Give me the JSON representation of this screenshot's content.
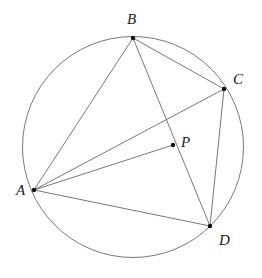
{
  "figure": {
    "kind": "geometry-diagram",
    "width": 262,
    "height": 278,
    "background_color": "#ffffff",
    "stroke_color": "#555555",
    "point_color": "#111111",
    "label_color": "#1a1a1a",
    "stroke_width": 0.8
  },
  "circle": {
    "name": "circumcircle",
    "cx": 133,
    "cy": 147,
    "r": 110.5
  },
  "points": [
    {
      "id": "A",
      "label": "A",
      "x": 34,
      "y": 190,
      "label_x": 16,
      "label_y": 183
    },
    {
      "id": "B",
      "label": "B",
      "x": 133,
      "y": 38,
      "label_x": 127,
      "label_y": 12
    },
    {
      "id": "C",
      "label": "C",
      "x": 224,
      "y": 89,
      "label_x": 233,
      "label_y": 72
    },
    {
      "id": "D",
      "label": "D",
      "x": 210,
      "y": 226,
      "label_x": 219,
      "label_y": 233
    },
    {
      "id": "P",
      "label": "P",
      "x": 173,
      "y": 145,
      "label_x": 181,
      "label_y": 135
    }
  ],
  "segments": [
    {
      "id": "AB",
      "from": "A",
      "to": "B",
      "role": "quadrilateral-side"
    },
    {
      "id": "BC",
      "from": "B",
      "to": "C",
      "role": "quadrilateral-side"
    },
    {
      "id": "CD",
      "from": "C",
      "to": "D",
      "role": "quadrilateral-side"
    },
    {
      "id": "DA",
      "from": "D",
      "to": "A",
      "role": "quadrilateral-side"
    },
    {
      "id": "AC",
      "from": "A",
      "to": "C",
      "role": "diagonal"
    },
    {
      "id": "BD",
      "from": "B",
      "to": "D",
      "role": "diagonal"
    },
    {
      "id": "AP",
      "from": "A",
      "to": "P",
      "role": "cevian"
    }
  ]
}
